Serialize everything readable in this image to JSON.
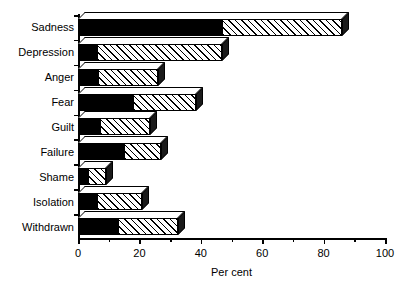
{
  "chart_data": {
    "type": "bar",
    "orientation": "horizontal",
    "stacked": true,
    "title": "",
    "xlabel": "Per cent",
    "ylabel": "",
    "xlim": [
      0,
      100
    ],
    "xticks": [
      0,
      20,
      40,
      60,
      80,
      100
    ],
    "xtick_labels": [
      "0",
      "20",
      "40",
      "60",
      "80",
      "100"
    ],
    "minor_xticks": [
      10,
      30,
      50,
      70,
      90
    ],
    "grid": false,
    "legend": "none",
    "categories": [
      "Sadness",
      "Depression",
      "Anger",
      "Fear",
      "Guilt",
      "Failure",
      "Shame",
      "Isolation",
      "Withdrawn"
    ],
    "series": [
      {
        "name": "solid-black-segment",
        "fill": "solid black",
        "values": [
          47,
          6,
          6.5,
          18,
          7,
          15,
          3,
          6,
          13
        ]
      },
      {
        "name": "hatched-segment",
        "fill": "diagonal hatch",
        "values": [
          39,
          41,
          19.5,
          20.5,
          16.5,
          12,
          6,
          15,
          19.5
        ]
      }
    ],
    "totals": [
      86,
      47,
      26,
      38.5,
      23.5,
      27,
      9,
      21,
      32.5
    ]
  },
  "style": {
    "ink": "#000000",
    "paper": "#ffffff",
    "side_face": "#1a1a1a"
  }
}
